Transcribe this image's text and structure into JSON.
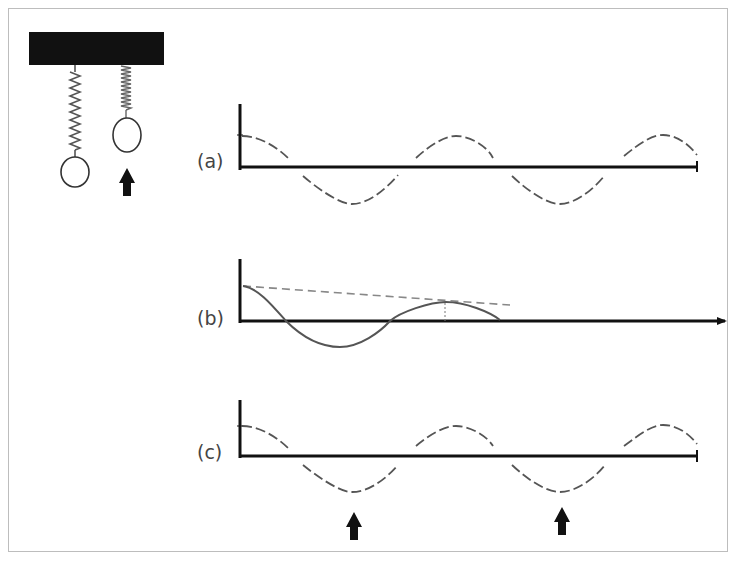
{
  "figure": {
    "labels": {
      "a": "(a)",
      "b": "(b)",
      "c": "(c)"
    },
    "colors": {
      "ink": "#111111",
      "curve": "#555555",
      "frame": "#bdbdbd"
    }
  },
  "springs": [
    {
      "name": "extended-spring",
      "state": "stretched"
    },
    {
      "name": "compressed-spring",
      "state": "compressed",
      "arrow": "up"
    }
  ],
  "panels": [
    {
      "id": "a",
      "description": "undamped oscillation, constant amplitude"
    },
    {
      "id": "b",
      "description": "damped oscillation, decaying amplitude with dashed envelope"
    },
    {
      "id": "c",
      "description": "oscillation with periodic pushes (arrows) at troughs"
    }
  ]
}
